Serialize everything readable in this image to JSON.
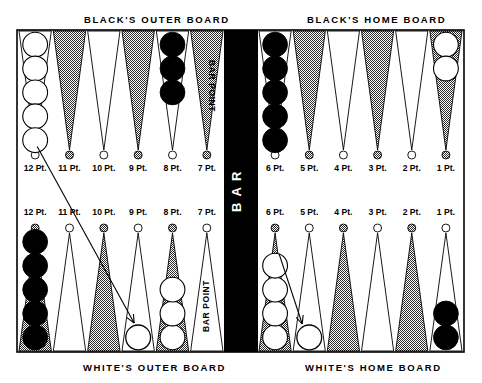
{
  "figure": {
    "title_top_left": "BLACK'S OUTER BOARD",
    "title_top_right": "BLACK'S HOME BOARD",
    "title_bottom_left": "WHITE'S OUTER BOARD",
    "title_bottom_right": "WHITE'S HOME BOARD",
    "bar_label": "B A R",
    "bar_point_label_top": "BAR POINT",
    "bar_point_label_bottom": "BAR POINT"
  },
  "colors": {
    "background": "#ffffff",
    "board_surface": "#ffffff",
    "bar": "#000000",
    "point_shaded": "#8a8a8a",
    "point_light": "#ffffff",
    "checker_black": "#000000",
    "checker_white": "#ffffff",
    "outline": "#000000"
  },
  "labels": {
    "top_points": [
      "12 Pt.",
      "11 Pt.",
      "10 Pt.",
      "9 Pt.",
      "8 Pt.",
      "7 Pt.",
      "6 Pt.",
      "5 Pt.",
      "4 Pt.",
      "3 Pt.",
      "2 Pt.",
      "1 Pt."
    ],
    "bottom_points": [
      "12 Pt.",
      "11 Pt.",
      "10 Pt.",
      "9 Pt.",
      "8 Pt.",
      "7 Pt.",
      "6 Pt.",
      "5 Pt.",
      "4 Pt.",
      "3 Pt.",
      "2 Pt.",
      "1 Pt."
    ]
  },
  "chart_data": {
    "type": "diagram",
    "top_row": [
      {
        "point": "12 Pt.",
        "shade": "light",
        "checkers": 5,
        "color": "white"
      },
      {
        "point": "11 Pt.",
        "shade": "shaded",
        "checkers": 0,
        "color": null
      },
      {
        "point": "10 Pt.",
        "shade": "light",
        "checkers": 0,
        "color": null
      },
      {
        "point": "9 Pt.",
        "shade": "shaded",
        "checkers": 0,
        "color": null
      },
      {
        "point": "8 Pt.",
        "shade": "light",
        "checkers": 3,
        "color": "black"
      },
      {
        "point": "7 Pt.",
        "shade": "shaded",
        "checkers": 0,
        "color": null
      },
      {
        "point": "6 Pt.",
        "shade": "light",
        "checkers": 5,
        "color": "black"
      },
      {
        "point": "5 Pt.",
        "shade": "shaded",
        "checkers": 0,
        "color": null
      },
      {
        "point": "4 Pt.",
        "shade": "light",
        "checkers": 0,
        "color": null
      },
      {
        "point": "3 Pt.",
        "shade": "shaded",
        "checkers": 0,
        "color": null
      },
      {
        "point": "2 Pt.",
        "shade": "light",
        "checkers": 0,
        "color": null
      },
      {
        "point": "1 Pt.",
        "shade": "shaded",
        "checkers": 2,
        "color": "white"
      }
    ],
    "bottom_row": [
      {
        "point": "12 Pt.",
        "shade": "shaded",
        "checkers": 5,
        "color": "black"
      },
      {
        "point": "11 Pt.",
        "shade": "light",
        "checkers": 0,
        "color": null
      },
      {
        "point": "10 Pt.",
        "shade": "shaded",
        "checkers": 0,
        "color": null
      },
      {
        "point": "9 Pt.",
        "shade": "light",
        "checkers": 0,
        "color": null
      },
      {
        "point": "8 Pt.",
        "shade": "shaded",
        "checkers": 3,
        "color": "white"
      },
      {
        "point": "7 Pt.",
        "shade": "light",
        "checkers": 0,
        "color": null
      },
      {
        "point": "6 Pt.",
        "shade": "shaded",
        "checkers": 4,
        "color": "white"
      },
      {
        "point": "5 Pt.",
        "shade": "light",
        "checkers": 0,
        "color": null
      },
      {
        "point": "4 Pt.",
        "shade": "shaded",
        "checkers": 0,
        "color": null
      },
      {
        "point": "3 Pt.",
        "shade": "light",
        "checkers": 0,
        "color": null
      },
      {
        "point": "2 Pt.",
        "shade": "shaded",
        "checkers": 0,
        "color": null
      },
      {
        "point": "1 Pt.",
        "shade": "light",
        "checkers": 2,
        "color": "black"
      }
    ],
    "moves": [
      {
        "from": "top 12 Pt.",
        "to": "bottom 9 Pt.",
        "target_marker": "empty-circle"
      },
      {
        "from": "bottom 6 Pt.",
        "to": "bottom 5 Pt.",
        "target_marker": "empty-circle"
      }
    ]
  }
}
